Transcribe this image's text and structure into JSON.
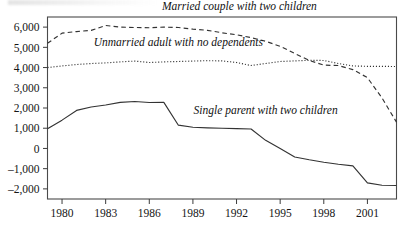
{
  "chart_data": {
    "type": "line",
    "title": "",
    "xlabel": "",
    "ylabel": "",
    "xlim": [
      1979,
      2003
    ],
    "ylim": [
      -2500,
      6500
    ],
    "grid": false,
    "legend": "inline-labels",
    "y_ticks": [
      6000,
      5000,
      4000,
      3000,
      2000,
      1000,
      0,
      -1000,
      -2000
    ],
    "y_tick_labels": [
      "6,000",
      "5,000",
      "4,000",
      "3,000",
      "2,000",
      "1,000",
      "0",
      "–1,000",
      "–2,000"
    ],
    "x_ticks": [
      1980,
      1983,
      1986,
      1989,
      1992,
      1995,
      1998,
      2001
    ],
    "x_tick_labels": [
      "1980",
      "1983",
      "1986",
      "1989",
      "1992",
      "1995",
      "1998",
      "2001"
    ],
    "x": [
      1979,
      1980,
      1981,
      1982,
      1983,
      1984,
      1985,
      1986,
      1987,
      1988,
      1989,
      1990,
      1991,
      1992,
      1993,
      1994,
      1995,
      1996,
      1997,
      1998,
      1999,
      2000,
      2001,
      2002,
      2003
    ],
    "series": [
      {
        "name": "Married couple with two children",
        "style": "dashed",
        "label_x": 1992.2,
        "label_y": 6850,
        "values": [
          5200,
          5700,
          5780,
          5840,
          6080,
          6000,
          5980,
          5970,
          6000,
          5980,
          5900,
          5840,
          5720,
          5620,
          5480,
          5300,
          5050,
          4700,
          4350,
          4120,
          4100,
          3900,
          3500,
          2500,
          1300
        ]
      },
      {
        "name": "Unmarried adult with no dependents",
        "style": "dotted",
        "label_x": 1988.0,
        "label_y": 5050,
        "values": [
          4000,
          4080,
          4150,
          4200,
          4230,
          4280,
          4320,
          4250,
          4280,
          4300,
          4320,
          4340,
          4330,
          4250,
          4100,
          4200,
          4300,
          4330,
          4360,
          4350,
          4200,
          4080,
          4060,
          4060,
          4050
        ]
      },
      {
        "name": "Single parent with two children",
        "style": "solid",
        "label_x": 1994.0,
        "label_y": 1700,
        "values": [
          980,
          1400,
          1880,
          2050,
          2150,
          2280,
          2320,
          2270,
          2280,
          1150,
          1050,
          1020,
          1000,
          980,
          960,
          400,
          0,
          -420,
          -560,
          -680,
          -780,
          -860,
          -1700,
          -1820,
          -1830
        ]
      }
    ]
  }
}
